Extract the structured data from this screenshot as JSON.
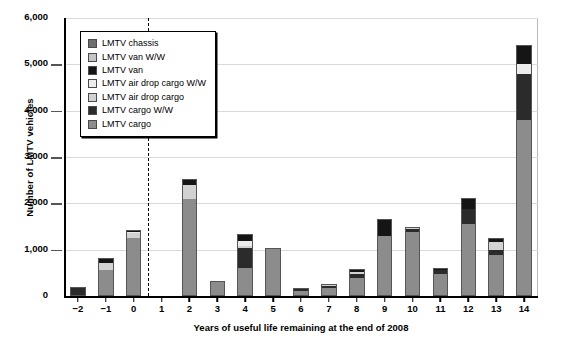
{
  "chart_data": {
    "type": "bar",
    "subtype": "stacked",
    "title": "",
    "xlabel": "Years of useful life remaining at the end of 2008",
    "ylabel": "Number of LMTV vehicles",
    "ylim": [
      0,
      6000
    ],
    "ytick_values": [
      0,
      1000,
      2000,
      3000,
      4000,
      5000,
      6000
    ],
    "ytick_labels": [
      "0",
      "1,000",
      "2,000",
      "3,000",
      "4,000",
      "5,000",
      "6,000"
    ],
    "grid": true,
    "legend_position": "upper-left-inside",
    "annotations": [
      {
        "type": "vertical-dashed-line",
        "x": "between 0 and 1",
        "label": ""
      }
    ],
    "categories": [
      "−2",
      "−1",
      "0",
      "1",
      "2",
      "3",
      "4",
      "5",
      "6",
      "7",
      "8",
      "9",
      "10",
      "11",
      "12",
      "13",
      "14"
    ],
    "series": [
      {
        "name": "LMTV cargo",
        "color": "#8c8c8c",
        "values": [
          0,
          560,
          1260,
          0,
          2100,
          320,
          600,
          1030,
          120,
          180,
          390,
          1310,
          1400,
          480,
          1570,
          900,
          3800
        ]
      },
      {
        "name": "LMTV cargo W/W",
        "color": "#2b2b2b",
        "values": [
          190,
          0,
          0,
          0,
          0,
          0,
          440,
          0,
          50,
          50,
          110,
          0,
          60,
          90,
          320,
          110,
          1000
        ]
      },
      {
        "name": "LMTV air drop cargo",
        "color": "#d2d2d2",
        "values": [
          0,
          160,
          120,
          0,
          310,
          0,
          50,
          0,
          0,
          30,
          40,
          0,
          20,
          0,
          0,
          180,
          0
        ]
      },
      {
        "name": "LMTV air drop cargo W/W",
        "color": "#ececec",
        "values": [
          0,
          0,
          20,
          0,
          0,
          0,
          110,
          0,
          0,
          0,
          0,
          0,
          0,
          0,
          0,
          0,
          220
        ]
      },
      {
        "name": "LMTV van",
        "color": "#151515",
        "values": [
          0,
          90,
          20,
          0,
          110,
          0,
          130,
          0,
          0,
          0,
          50,
          360,
          20,
          30,
          230,
          60,
          400
        ]
      },
      {
        "name": "LMTV van W/W",
        "color": "#c4c4c4",
        "values": [
          0,
          0,
          0,
          0,
          0,
          0,
          0,
          0,
          0,
          0,
          0,
          0,
          0,
          0,
          0,
          0,
          0
        ]
      },
      {
        "name": "LMTV chassis",
        "color": "#6e6e6e",
        "values": [
          0,
          0,
          0,
          0,
          0,
          0,
          0,
          0,
          0,
          0,
          0,
          0,
          0,
          0,
          0,
          0,
          0
        ]
      }
    ],
    "totals": [
      190,
      810,
      1420,
      0,
      2520,
      320,
      1330,
      1030,
      170,
      260,
      590,
      1670,
      1500,
      600,
      2120,
      1250,
      5420
    ]
  },
  "legend": {
    "items": [
      {
        "label": "LMTV chassis",
        "color": "#6e6e6e"
      },
      {
        "label": "LMTV van W/W",
        "color": "#c4c4c4"
      },
      {
        "label": "LMTV van",
        "color": "#151515"
      },
      {
        "label": "LMTV air drop cargo W/W",
        "color": "#ececec"
      },
      {
        "label": "LMTV air drop cargo",
        "color": "#d2d2d2"
      },
      {
        "label": "LMTV cargo W/W",
        "color": "#2b2b2b"
      },
      {
        "label": "LMTV cargo",
        "color": "#8c8c8c"
      }
    ]
  }
}
